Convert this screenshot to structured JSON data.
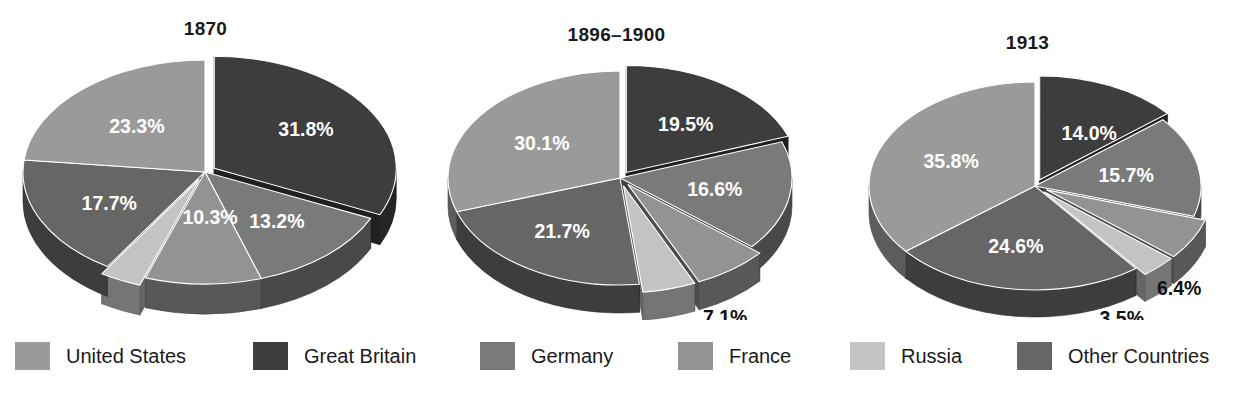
{
  "colors": {
    "united_states": "#9a9a9a",
    "great_britain": "#3d3d3d",
    "germany": "#7a7a7a",
    "france": "#939393",
    "russia": "#c3c3c3",
    "other_countries": "#666666",
    "rim_dark": "#4a4a4a",
    "gb_rim": "#1c1c1c",
    "label_dark": "#111111",
    "label_light": "#ffffff",
    "background": "#ffffff"
  },
  "legend": {
    "items": [
      {
        "label": "United States",
        "key": "united_states",
        "x": 15,
        "swatch": "#9a9a9a"
      },
      {
        "label": "Great Britain",
        "key": "great_britain",
        "x": 253,
        "swatch": "#3d3d3d"
      },
      {
        "label": "Germany",
        "key": "germany",
        "x": 480,
        "swatch": "#7a7a7a"
      },
      {
        "label": "France",
        "key": "france",
        "x": 678,
        "swatch": "#939393"
      },
      {
        "label": "Russia",
        "key": "russia",
        "x": 850,
        "swatch": "#c3c3c3"
      },
      {
        "label": "Other Countries",
        "key": "other_countries",
        "x": 1017,
        "swatch": "#666666"
      }
    ]
  },
  "chart_data": [
    {
      "type": "pie",
      "title": "1870",
      "categories": [
        "Great Britain",
        "Germany",
        "France",
        "Russia",
        "Other Countries",
        "United States"
      ],
      "values": [
        31.8,
        13.2,
        10.3,
        3.7,
        17.7,
        23.3
      ],
      "labels": [
        "31.8%",
        "13.2%",
        "10.3%",
        "3.7%",
        "17.7%",
        "23.3%"
      ],
      "exploded": [
        "Great Britain",
        "Russia"
      ],
      "legend_position": "bottom",
      "grid": false
    },
    {
      "type": "pie",
      "title": "1896–1900",
      "categories": [
        "Great Britain",
        "Germany",
        "France",
        "Russia",
        "Other Countries",
        "United States"
      ],
      "values": [
        19.5,
        16.6,
        7.1,
        5.0,
        21.7,
        30.1
      ],
      "labels": [
        "19.5%",
        "16.6%",
        "7.1%",
        "5.0%",
        "21.7%",
        "30.1%"
      ],
      "exploded": [
        "Great Britain",
        "France",
        "Russia"
      ],
      "legend_position": "bottom",
      "grid": false
    },
    {
      "type": "pie",
      "title": "1913",
      "categories": [
        "Great Britain",
        "Germany",
        "France",
        "Russia",
        "Other Countries",
        "United States"
      ],
      "values": [
        14.0,
        15.7,
        6.4,
        3.5,
        24.6,
        35.8
      ],
      "labels": [
        "14.0%",
        "15.7%",
        "6.4%",
        "3.5%",
        "24.6%",
        "35.8%"
      ],
      "exploded": [
        "Great Britain",
        "France",
        "Russia"
      ],
      "legend_position": "bottom",
      "grid": false
    }
  ],
  "pie_geometry": [
    {
      "cx": 205,
      "cy": 172,
      "rx": 182,
      "ry": 112,
      "depth": 30,
      "title_y": 18
    },
    {
      "cx": 620,
      "cy": 178,
      "rx": 172,
      "ry": 107,
      "depth": 28,
      "title_y": 24
    },
    {
      "cx": 1035,
      "cy": 186,
      "rx": 166,
      "ry": 104,
      "depth": 27,
      "title_y": 32
    }
  ]
}
